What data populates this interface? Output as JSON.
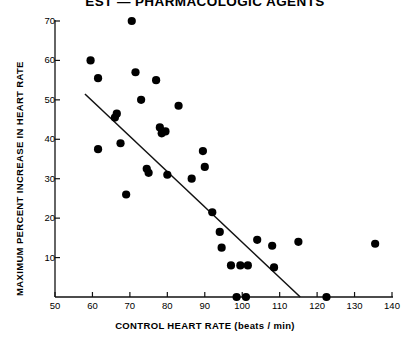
{
  "chart_data": {
    "type": "scatter",
    "title": "EST — PHARMACOLOGIC AGENTS",
    "xlabel": "CONTROL  HEART  RATE   (beats / min)",
    "ylabel": "MAXIMUM  PERCENT  INCREASE  IN  HEART  RATE",
    "xlim": [
      50,
      140
    ],
    "ylim": [
      0,
      70
    ],
    "xticks": [
      50,
      60,
      70,
      80,
      90,
      100,
      110,
      120,
      130,
      140
    ],
    "yticks": [
      10,
      20,
      30,
      40,
      50,
      60,
      70
    ],
    "xtick_labels": [
      "50",
      "60",
      "70",
      "80",
      "90",
      "100",
      "110",
      "120",
      "130",
      "140"
    ],
    "ytick_labels": [
      "10",
      "20",
      "30",
      "40",
      "50",
      "60",
      "70"
    ],
    "grid": false,
    "legend": null,
    "marker": "filled-circle",
    "marker_color": "#000000",
    "points": [
      {
        "x": 59.5,
        "y": 60.0
      },
      {
        "x": 61.5,
        "y": 55.5
      },
      {
        "x": 61.5,
        "y": 37.5
      },
      {
        "x": 66.0,
        "y": 45.5
      },
      {
        "x": 66.5,
        "y": 46.5
      },
      {
        "x": 67.5,
        "y": 39.0
      },
      {
        "x": 69.0,
        "y": 26.0
      },
      {
        "x": 70.5,
        "y": 70.0
      },
      {
        "x": 71.5,
        "y": 57.0
      },
      {
        "x": 73.0,
        "y": 50.0
      },
      {
        "x": 74.5,
        "y": 32.5
      },
      {
        "x": 75.0,
        "y": 31.5
      },
      {
        "x": 77.0,
        "y": 55.0
      },
      {
        "x": 78.0,
        "y": 43.0
      },
      {
        "x": 78.5,
        "y": 41.5
      },
      {
        "x": 79.5,
        "y": 42.0
      },
      {
        "x": 80.0,
        "y": 31.0
      },
      {
        "x": 83.0,
        "y": 48.5
      },
      {
        "x": 86.5,
        "y": 30.0
      },
      {
        "x": 89.5,
        "y": 37.0
      },
      {
        "x": 90.0,
        "y": 33.0
      },
      {
        "x": 92.0,
        "y": 21.5
      },
      {
        "x": 94.0,
        "y": 16.5
      },
      {
        "x": 94.5,
        "y": 12.5
      },
      {
        "x": 97.0,
        "y": 8.0
      },
      {
        "x": 98.5,
        "y": 0.0
      },
      {
        "x": 99.5,
        "y": 8.0
      },
      {
        "x": 101.0,
        "y": 0.0
      },
      {
        "x": 101.5,
        "y": 8.0
      },
      {
        "x": 104.0,
        "y": 14.5
      },
      {
        "x": 108.0,
        "y": 13.0
      },
      {
        "x": 108.5,
        "y": 7.5
      },
      {
        "x": 115.0,
        "y": 14.0
      },
      {
        "x": 122.5,
        "y": 0.0
      },
      {
        "x": 135.5,
        "y": 13.5
      }
    ],
    "regression_line": {
      "x0": 58.0,
      "y0": 51.5,
      "x1": 115.5,
      "y1": 0.0
    }
  }
}
